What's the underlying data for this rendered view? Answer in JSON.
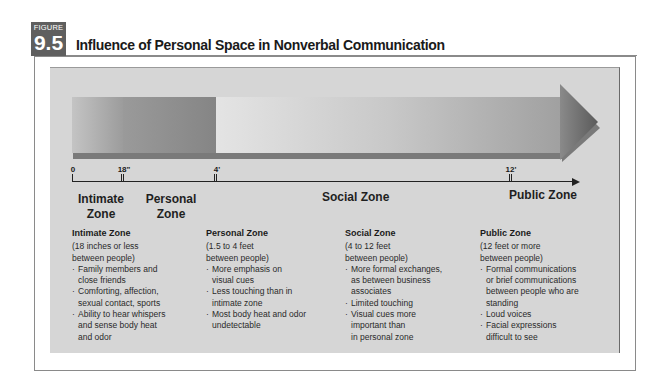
{
  "figure": {
    "label": "FIGURE",
    "number": "9.5",
    "title": "Influence of Personal Space in Nonverbal Communication"
  },
  "colors": {
    "badge": "#5f5f5f",
    "panel": "#d6d6d6",
    "frame": "#8a8a8a"
  },
  "scale": {
    "ticks": [
      {
        "label": "0"
      },
      {
        "label": "18\""
      },
      {
        "label": "4'"
      },
      {
        "label": "12'"
      }
    ]
  },
  "zones": [
    {
      "short_label": "Intimate Zone",
      "heading": "Intimate Zone",
      "range": "(18 inches or less\nbetween people)",
      "bullets": [
        "Family members and\nclose friends",
        "Comforting, affection,\nsexual contact, sports",
        "Ability to hear whispers\nand sense body heat\nand odor"
      ]
    },
    {
      "short_label": "Personal Zone",
      "heading": "Personal Zone",
      "range": "(1.5 to 4 feet\nbetween people)",
      "bullets": [
        "More emphasis on\nvisual cues",
        "Less touching than in\nintimate zone",
        "Most body heat and odor\nundetectable"
      ]
    },
    {
      "short_label": "Social Zone",
      "heading": "Social Zone",
      "range": "(4 to 12 feet\nbetween people)",
      "bullets": [
        "More formal exchanges,\nas between business\nassociates",
        "Limited touching",
        "Visual cues more\nimportant than\nin personal zone"
      ]
    },
    {
      "short_label": "Public Zone",
      "heading": "Public Zone",
      "range": "(12 feet or more\nbetween people)",
      "bullets": [
        "Formal communications\nor brief communications\nbetween people who are\nstanding",
        "Loud voices",
        "Facial expressions\ndifficult to see"
      ]
    }
  ]
}
